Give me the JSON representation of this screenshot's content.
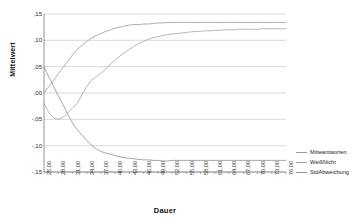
{
  "chart_data": {
    "type": "line",
    "title": "",
    "xlabel": "Dauer",
    "ylabel": "Mittelwert",
    "grid": true,
    "legend_position": "right",
    "xlim": [
      25,
      76
    ],
    "ylim": [
      -0.15,
      0.15
    ],
    "ytick_labels": [
      ",15",
      ",10",
      ",05",
      ",00",
      "-,05",
      "-,10",
      "-,15"
    ],
    "ytick_values": [
      0.15,
      0.1,
      0.05,
      0.0,
      -0.05,
      -0.1,
      -0.15
    ],
    "xtick_labels": [
      "25,00",
      "28,00",
      "31,00",
      "34,00",
      "37,00",
      "40,00",
      "43,00",
      "46,00",
      "49,00",
      "52,00",
      "55,00",
      "58,00",
      "61,00",
      "64,00",
      "67,00",
      "70,00",
      "73,00",
      "76,00"
    ],
    "xtick_values": [
      25,
      28,
      31,
      34,
      37,
      40,
      43,
      46,
      49,
      52,
      55,
      58,
      61,
      64,
      67,
      70,
      73,
      76
    ],
    "x": [
      25,
      26,
      27,
      28,
      29,
      30,
      31,
      32,
      33,
      34,
      35,
      36,
      37,
      38,
      39,
      40,
      41,
      42,
      43,
      44,
      45,
      46,
      47,
      48,
      49,
      50,
      51,
      52,
      53,
      54,
      55,
      56,
      57,
      58,
      59,
      60,
      61,
      62,
      63,
      64,
      65,
      66,
      67,
      68,
      69,
      70,
      71,
      72,
      73,
      74,
      75,
      76
    ],
    "series": [
      {
        "name": "Mitteantworten",
        "color": "#9a9a9a",
        "values": [
          0.0,
          0.012,
          0.024,
          0.036,
          0.048,
          0.06,
          0.072,
          0.083,
          0.09,
          0.098,
          0.104,
          0.109,
          0.113,
          0.117,
          0.12,
          0.123,
          0.125,
          0.127,
          0.129,
          0.13,
          0.13,
          0.131,
          0.131,
          0.132,
          0.133,
          0.133,
          0.134,
          0.134,
          0.134,
          0.134,
          0.134,
          0.134,
          0.134,
          0.134,
          0.134,
          0.134,
          0.134,
          0.134,
          0.134,
          0.134,
          0.134,
          0.134,
          0.134,
          0.134,
          0.134,
          0.134,
          0.134,
          0.134,
          0.134,
          0.134,
          0.134,
          0.134
        ]
      },
      {
        "name": "WeißNicht",
        "color": "#a5a5a5",
        "values": [
          -0.02,
          -0.037,
          -0.047,
          -0.05,
          -0.046,
          -0.038,
          -0.028,
          -0.02,
          -0.003,
          0.012,
          0.024,
          0.031,
          0.038,
          0.045,
          0.055,
          0.062,
          0.07,
          0.077,
          0.083,
          0.089,
          0.094,
          0.098,
          0.102,
          0.105,
          0.107,
          0.109,
          0.111,
          0.112,
          0.113,
          0.114,
          0.115,
          0.116,
          0.117,
          0.117,
          0.118,
          0.118,
          0.119,
          0.119,
          0.12,
          0.12,
          0.12,
          0.121,
          0.121,
          0.121,
          0.121,
          0.121,
          0.122,
          0.122,
          0.122,
          0.122,
          0.122,
          0.122
        ]
      },
      {
        "name": "StdAbweichung",
        "color": "#8f8f8f",
        "values": [
          0.049,
          0.031,
          0.013,
          -0.005,
          -0.022,
          -0.04,
          -0.057,
          -0.07,
          -0.08,
          -0.09,
          -0.099,
          -0.106,
          -0.111,
          -0.114,
          -0.116,
          -0.119,
          -0.121,
          -0.123,
          -0.124,
          -0.125,
          -0.126,
          -0.127,
          -0.127,
          -0.128,
          -0.128,
          -0.129,
          -0.129,
          -0.128,
          -0.128,
          -0.128,
          -0.128,
          -0.128,
          -0.128,
          -0.128,
          -0.128,
          -0.128,
          -0.128,
          -0.128,
          -0.128,
          -0.128,
          -0.128,
          -0.128,
          -0.128,
          -0.128,
          -0.128,
          -0.128,
          -0.128,
          -0.128,
          -0.128,
          -0.128,
          -0.128,
          -0.128
        ]
      }
    ]
  },
  "axes": {
    "y_title": "Mittelwert",
    "x_title": "Dauer"
  },
  "legend": {
    "items": [
      {
        "label": "Mitteantworten"
      },
      {
        "label": "WeißNicht"
      },
      {
        "label": "StdAbweichung"
      }
    ]
  },
  "style": {
    "grid_color": "#c8c8c8",
    "axis_color": "#7a7a7a",
    "plot_bg": "#ffffff"
  }
}
